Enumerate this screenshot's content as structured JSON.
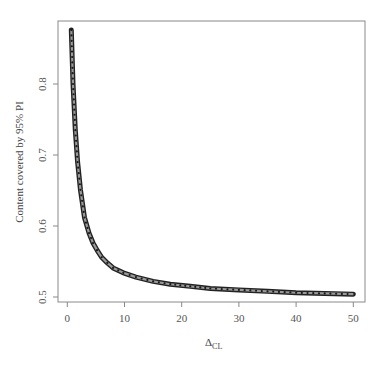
{
  "chart_data": {
    "type": "scatter",
    "title": "",
    "xlabel": "Δ_CL",
    "xlabel_main": "Δ",
    "xlabel_sub": "CL",
    "ylabel": "Content covered by 95% PI",
    "xlim": [
      -1.5,
      52
    ],
    "ylim": [
      0.49,
      0.89
    ],
    "xticks": [
      0,
      10,
      20,
      30,
      40,
      50
    ],
    "yticks": [
      0.5,
      0.6,
      0.7,
      0.8
    ],
    "xtick_labels": [
      "0",
      "10",
      "20",
      "30",
      "40",
      "50"
    ],
    "ytick_labels": [
      "0.5",
      "0.6",
      "0.7",
      "0.8"
    ],
    "grid": false,
    "legend": null,
    "series": [
      {
        "name": "content",
        "x": [
          0.7,
          1.0,
          1.4,
          1.8,
          2.3,
          3.0,
          3.8,
          4.5,
          5.2,
          6.0,
          7.0,
          8.0,
          9.8,
          12.0,
          15.0,
          18.0,
          21.5,
          25.0,
          30.0,
          35.0,
          40.0,
          45.0,
          50.0
        ],
        "y": [
          0.876,
          0.8,
          0.735,
          0.69,
          0.651,
          0.612,
          0.59,
          0.576,
          0.566,
          0.556,
          0.548,
          0.541,
          0.534,
          0.528,
          0.522,
          0.518,
          0.515,
          0.512,
          0.51,
          0.508,
          0.506,
          0.505,
          0.504
        ]
      }
    ],
    "colors": {
      "marker_edge": "#222222",
      "marker_fill": "#9a9a9a",
      "axis": "#888888",
      "text": "#555555"
    }
  }
}
